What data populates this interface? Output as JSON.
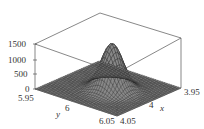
{
  "chart_data": {
    "type": "surface3d",
    "title": "",
    "xlabel": "x",
    "ylabel": "y",
    "zlabel": "",
    "x_ticks": [
      "3.95",
      "4",
      "4.05"
    ],
    "y_ticks": [
      "5.95",
      "6",
      "6.05"
    ],
    "z_ticks": [
      "0",
      "500",
      "1000",
      "1500"
    ],
    "xlim": [
      3.95,
      4.05
    ],
    "ylim": [
      5.95,
      6.05
    ],
    "zlim": [
      0,
      1500
    ],
    "peak": {
      "x": 4.0,
      "y": 6.0,
      "z": 1550
    },
    "surface_color": "#888888",
    "mesh_color": "#222222",
    "box": true
  }
}
